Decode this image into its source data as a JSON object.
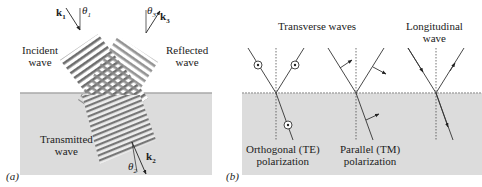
{
  "figure": {
    "panel_a": {
      "tag": "(a)",
      "incident_label": [
        "Incident",
        "wave"
      ],
      "reflected_label": [
        "Reflected",
        "wave"
      ],
      "transmitted_label": [
        "Transmitted",
        "wave"
      ],
      "k1": "k",
      "k1_sub": "1",
      "k2": "k",
      "k2_sub": "2",
      "k3": "k",
      "k3_sub": "3",
      "theta1": "θ",
      "theta1_sub": "1",
      "theta2": "θ",
      "theta2_sub": "2",
      "theta3": "θ",
      "theta3_sub": "3"
    },
    "panel_b": {
      "tag": "(b)",
      "transverse_title": "Transverse  waves",
      "longitudinal_title": [
        "Longitudinal",
        "wave"
      ],
      "te_label": [
        "Orthogonal (TE)",
        "polarization"
      ],
      "tm_label": [
        "Parallel (TM)",
        "polarization"
      ]
    },
    "colors": {
      "medium": "#dcdcdc",
      "interface": "#a8a8a8",
      "line": "#333333",
      "wave_dark": "#555555"
    }
  }
}
